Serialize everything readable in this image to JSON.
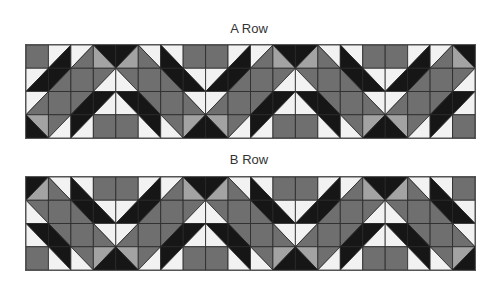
{
  "colors": {
    "G": "#6f6f6f",
    "D": "#161616",
    "W": "#f2f2f2",
    "L": "#a3a3a3",
    "grid": "#2a2a2a"
  },
  "grid": {
    "columns": 20,
    "rows": 4
  },
  "tile": {
    "legend": "Each cell: [diagonal, colorA, colorB]. '/' = colorA top-left, colorB bottom-right; '\\\\' = colorA top-right, colorB bottom-left; 's' = solid colorA.",
    "columns": [
      [
        [
          "\\",
          "D",
          "L"
        ],
        [
          "/",
          "G",
          "W"
        ],
        [
          "/",
          "D",
          "W"
        ],
        [
          "s",
          "G"
        ]
      ],
      [
        [
          "/",
          "D",
          "L"
        ],
        [
          "\\",
          "G",
          "W"
        ],
        [
          "\\",
          "D",
          "W"
        ],
        [
          "s",
          "G"
        ]
      ],
      [
        [
          "\\",
          "W",
          "G"
        ],
        [
          "s",
          "G"
        ],
        [
          "\\",
          "G",
          "D"
        ],
        [
          "\\",
          "D",
          "W"
        ]
      ],
      [
        [
          "\\",
          "W",
          "D"
        ],
        [
          "\\",
          "D",
          "G"
        ],
        [
          "s",
          "G"
        ],
        [
          "\\",
          "G",
          "W"
        ]
      ],
      [
        [
          "s",
          "G"
        ],
        [
          "\\",
          "W",
          "D"
        ],
        [
          "\\",
          "W",
          "G"
        ],
        [
          "/",
          "L",
          "D"
        ]
      ],
      [
        [
          "s",
          "G"
        ],
        [
          "/",
          "W",
          "D"
        ],
        [
          "/",
          "W",
          "G"
        ],
        [
          "\\",
          "L",
          "D"
        ]
      ],
      [
        [
          "/",
          "W",
          "D"
        ],
        [
          "/",
          "D",
          "G"
        ],
        [
          "s",
          "G"
        ],
        [
          "/",
          "G",
          "W"
        ]
      ],
      [
        [
          "/",
          "W",
          "G"
        ],
        [
          "s",
          "G"
        ],
        [
          "/",
          "G",
          "D"
        ],
        [
          "/",
          "D",
          "W"
        ]
      ]
    ]
  },
  "panels": [
    {
      "id": "a-row",
      "title": "A Row",
      "tile_offset": 5
    },
    {
      "id": "b-row",
      "title": "B Row",
      "tile_offset": 1
    }
  ]
}
